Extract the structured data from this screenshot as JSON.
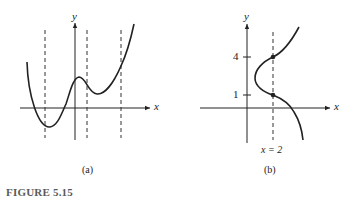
{
  "figure": {
    "caption": "FIGURE 5.15",
    "panels": [
      {
        "label": "(a)",
        "x_axis_label": "x",
        "y_axis_label": "y",
        "description": "Graph of a function with three dashed vertical lines each crossing the curve once"
      },
      {
        "label": "(b)",
        "x_axis_label": "x",
        "y_axis_label": "y",
        "tick_labels": [
          "4",
          "1"
        ],
        "vertical_line_label": "x = 2",
        "description": "Curve that is not a function; vertical line x = 2 crosses it at y = 1 and y = 4"
      }
    ]
  }
}
